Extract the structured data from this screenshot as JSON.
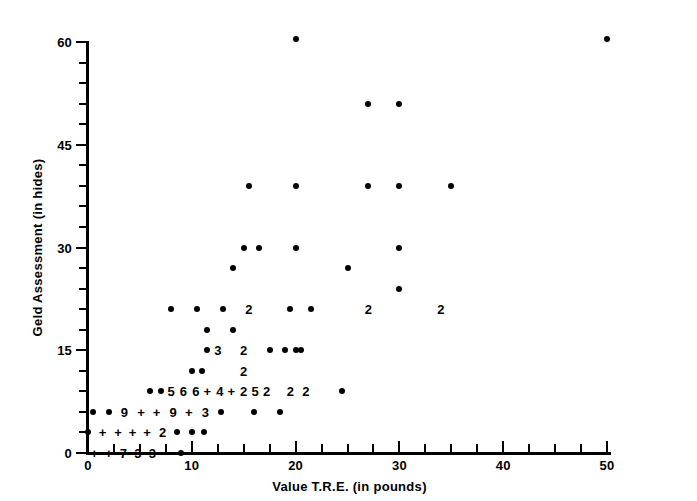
{
  "chart_data": {
    "type": "scatter",
    "title": "",
    "xlabel": "Value T.R.E. (in pounds)",
    "ylabel": "Geld Assessment (in hides)",
    "xlim": [
      0,
      50
    ],
    "ylim": [
      0,
      60
    ],
    "grid": false,
    "legend": null,
    "x_ticks_major": [
      0,
      10,
      20,
      30,
      40,
      50
    ],
    "x_tick_labels": [
      "0",
      "10",
      "20",
      "30",
      "40",
      "50"
    ],
    "x_ticks_minor": [
      2.5,
      5,
      7.5,
      12.5,
      15,
      17.5,
      22.5,
      25,
      27.5,
      32.5,
      35,
      37.5,
      42.5,
      45,
      47.5
    ],
    "y_ticks_major": [
      0,
      15,
      30,
      45,
      60
    ],
    "y_tick_labels": [
      "0",
      "15",
      "30",
      "45",
      "60"
    ],
    "y_ticks_minor": [
      3,
      6,
      9,
      12,
      18,
      21,
      24,
      27,
      33,
      36,
      39,
      42,
      48,
      51,
      54,
      57
    ],
    "marker": "filled-circle",
    "marker_color": "#000000",
    "overlap_label_note": "Digits and plus signs mark coincident observations; a digit is the count of points at that location, '+' marks counts of ten or more, '-' marks a tied cluster.",
    "points": [
      {
        "x": 50,
        "y": 60.5,
        "label": null
      },
      {
        "x": 20,
        "y": 60.5,
        "label": null
      },
      {
        "x": 27,
        "y": 51,
        "label": null
      },
      {
        "x": 30,
        "y": 51,
        "label": null
      },
      {
        "x": 20,
        "y": 39,
        "label": null
      },
      {
        "x": 27,
        "y": 39,
        "label": null
      },
      {
        "x": 30,
        "y": 39,
        "label": null
      },
      {
        "x": 35,
        "y": 39,
        "label": null
      },
      {
        "x": 15.5,
        "y": 39,
        "label": null
      },
      {
        "x": 20,
        "y": 30,
        "label": null
      },
      {
        "x": 30,
        "y": 30,
        "label": null
      },
      {
        "x": 15,
        "y": 30,
        "label": null
      },
      {
        "x": 16.5,
        "y": 30,
        "label": null
      },
      {
        "x": 14,
        "y": 27,
        "label": null
      },
      {
        "x": 25,
        "y": 27,
        "label": null
      },
      {
        "x": 30,
        "y": 24,
        "label": null
      },
      {
        "x": 8,
        "y": 21,
        "label": null
      },
      {
        "x": 10.5,
        "y": 21,
        "label": null
      },
      {
        "x": 13,
        "y": 21,
        "label": null
      },
      {
        "x": 15.5,
        "y": 21,
        "label": "2"
      },
      {
        "x": 19.5,
        "y": 21,
        "label": null
      },
      {
        "x": 21.5,
        "y": 21,
        "label": null
      },
      {
        "x": 27,
        "y": 21,
        "label": "2"
      },
      {
        "x": 34,
        "y": 21,
        "label": "2"
      },
      {
        "x": 11.5,
        "y": 18,
        "label": null
      },
      {
        "x": 14,
        "y": 18,
        "label": null
      },
      {
        "x": 11.5,
        "y": 15,
        "label": null
      },
      {
        "x": 12.5,
        "y": 15,
        "label": "3"
      },
      {
        "x": 15,
        "y": 15,
        "label": "2"
      },
      {
        "x": 17.5,
        "y": 15,
        "label": null
      },
      {
        "x": 19,
        "y": 15,
        "label": null
      },
      {
        "x": 20.5,
        "y": 15,
        "label": null
      },
      {
        "x": 20,
        "y": 15,
        "label": null
      },
      {
        "x": 10,
        "y": 12,
        "label": null
      },
      {
        "x": 11,
        "y": 12,
        "label": null
      },
      {
        "x": 15,
        "y": 12,
        "label": "2"
      },
      {
        "x": 6,
        "y": 9,
        "label": null
      },
      {
        "x": 7,
        "y": 9,
        "label": null
      },
      {
        "x": 8,
        "y": 9,
        "label": "5"
      },
      {
        "x": 9.2,
        "y": 9,
        "label": "6"
      },
      {
        "x": 10.4,
        "y": 9,
        "label": "6"
      },
      {
        "x": 11.5,
        "y": 9,
        "label": "+"
      },
      {
        "x": 12.7,
        "y": 9,
        "label": "4"
      },
      {
        "x": 13.8,
        "y": 9,
        "label": "+"
      },
      {
        "x": 15,
        "y": 9,
        "label": "2"
      },
      {
        "x": 16.1,
        "y": 9,
        "label": "5"
      },
      {
        "x": 17.2,
        "y": 9,
        "label": "2"
      },
      {
        "x": 19.5,
        "y": 9,
        "label": "2"
      },
      {
        "x": 21,
        "y": 9,
        "label": "2"
      },
      {
        "x": 24.5,
        "y": 9,
        "label": null
      },
      {
        "x": 0.5,
        "y": 6,
        "label": null
      },
      {
        "x": 2,
        "y": 6,
        "label": null
      },
      {
        "x": 3.5,
        "y": 6,
        "label": "9"
      },
      {
        "x": 5.1,
        "y": 6,
        "label": "+"
      },
      {
        "x": 6.6,
        "y": 6,
        "label": "+"
      },
      {
        "x": 8.2,
        "y": 6,
        "label": "9"
      },
      {
        "x": 9.7,
        "y": 6,
        "label": "+"
      },
      {
        "x": 11.3,
        "y": 6,
        "label": "3"
      },
      {
        "x": 12.8,
        "y": 6,
        "label": null
      },
      {
        "x": 16,
        "y": 6,
        "label": null
      },
      {
        "x": 18.5,
        "y": 6,
        "label": null
      },
      {
        "x": 0,
        "y": 3,
        "label": null
      },
      {
        "x": 1.4,
        "y": 3,
        "label": "+"
      },
      {
        "x": 2.9,
        "y": 3,
        "label": "+"
      },
      {
        "x": 4.3,
        "y": 3,
        "label": "+"
      },
      {
        "x": 5.7,
        "y": 3,
        "label": "+"
      },
      {
        "x": 7.2,
        "y": 3,
        "label": "2"
      },
      {
        "x": 8.6,
        "y": 3,
        "label": null
      },
      {
        "x": 10,
        "y": 3,
        "label": null
      },
      {
        "x": 11.2,
        "y": 3,
        "label": null
      },
      {
        "x": 0.6,
        "y": 0,
        "label": "+"
      },
      {
        "x": 2,
        "y": 0,
        "label": "+"
      },
      {
        "x": 3.4,
        "y": 0,
        "label": "7"
      },
      {
        "x": 4.8,
        "y": 0,
        "label": "3"
      },
      {
        "x": 6.2,
        "y": 0,
        "label": "3"
      },
      {
        "x": 7.6,
        "y": 0,
        "label": "-"
      },
      {
        "x": 9,
        "y": 0,
        "label": null
      }
    ]
  }
}
